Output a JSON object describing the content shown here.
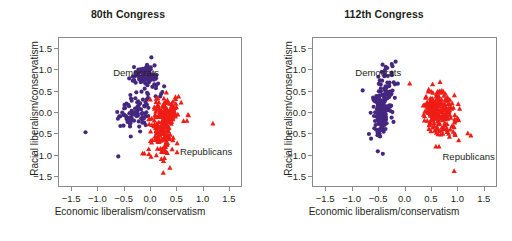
{
  "figure": {
    "background": "#ffffff",
    "axis_color": "#8a8a8a",
    "text_color": "#231f20"
  },
  "colors": {
    "democrat": "#45277f",
    "republican": "#ee1d16"
  },
  "chart_data": [
    {
      "type": "scatter",
      "title": "80th Congress",
      "xlabel": "Economic liberalism/conservatism",
      "ylabel": "Racial liberalism/conservatism",
      "xlim": [
        -1.75,
        1.75
      ],
      "ylim": [
        -1.75,
        1.75
      ],
      "xticks": [
        -1.5,
        -1.0,
        -0.5,
        0.0,
        0.5,
        1.0,
        1.5
      ],
      "xticklabels": [
        "−1.5",
        "−1.0",
        "−0.5",
        "0.0",
        "0.5",
        "1.0",
        "1.5"
      ],
      "yticks": [
        -1.5,
        -1.0,
        -0.5,
        0.0,
        0.5,
        1.0,
        1.5
      ],
      "yticklabels": [
        "−1.5",
        "−1.0",
        "−0.5",
        "0.0",
        "0.5",
        "1.0",
        "1.5"
      ],
      "grid": false,
      "legend_position": "inside-annotations",
      "annotations": [
        {
          "text": "Democrats",
          "x": -0.72,
          "y": 0.92
        },
        {
          "text": "Republicans",
          "x": 0.55,
          "y": -0.93
        }
      ],
      "series": [
        {
          "name": "Democrats",
          "marker": "circle",
          "color": "#45277f",
          "n": 188,
          "clusters": [
            {
              "cx": -0.07,
              "cy": 0.87,
              "sx": 0.115,
              "sy": 0.145,
              "n": 92,
              "seed": 11
            },
            {
              "cx": -0.3,
              "cy": -0.07,
              "sx": 0.135,
              "sy": 0.165,
              "n": 72,
              "seed": 23
            },
            {
              "cx": -0.1,
              "cy": 0.38,
              "sx": 0.12,
              "sy": 0.08,
              "n": 14,
              "seed": 37
            }
          ],
          "outliers": [
            {
              "x": -1.24,
              "y": -0.48
            },
            {
              "x": -0.61,
              "y": -1.05
            },
            {
              "x": -0.37,
              "y": -0.58
            },
            {
              "x": -0.19,
              "y": -0.46
            },
            {
              "x": 0.11,
              "y": 0.37
            },
            {
              "x": -0.63,
              "y": 0.0
            },
            {
              "x": -0.57,
              "y": -0.33
            }
          ]
        },
        {
          "name": "Republicans",
          "marker": "triangle",
          "color": "#ee1d16",
          "n": 246,
          "clusters": [
            {
              "cx": 0.24,
              "cy": -0.35,
              "sx": 0.135,
              "sy": 0.33,
              "n": 196,
              "seed": 41
            },
            {
              "cx": 0.42,
              "cy": -0.02,
              "sx": 0.125,
              "sy": 0.175,
              "n": 50,
              "seed": 53
            }
          ],
          "outliers": [
            {
              "x": 1.21,
              "y": -0.27
            },
            {
              "x": 0.74,
              "y": -0.07
            },
            {
              "x": 0.55,
              "y": 0.37
            },
            {
              "x": 0.49,
              "y": 0.36
            },
            {
              "x": -0.11,
              "y": -0.98
            },
            {
              "x": -0.02,
              "y": -0.99
            },
            {
              "x": 0.52,
              "y": -0.95
            }
          ]
        }
      ]
    },
    {
      "type": "scatter",
      "title": "112th Congress",
      "xlabel": "Economic liberalism/conservatism",
      "ylabel": "Racial liberalism/conservatism",
      "xlim": [
        -1.75,
        1.75
      ],
      "ylim": [
        -1.75,
        1.75
      ],
      "xticks": [
        -1.5,
        -1.0,
        -0.5,
        0.0,
        0.5,
        1.0,
        1.5
      ],
      "xticklabels": [
        "−1.5",
        "−1.0",
        "−0.5",
        "0.0",
        "0.5",
        "1.0",
        "1.5"
      ],
      "yticks": [
        -1.5,
        -1.0,
        -0.5,
        0.0,
        0.5,
        1.0,
        1.5
      ],
      "yticklabels": [
        "−1.5",
        "−1.0",
        "−0.5",
        "0.0",
        "0.5",
        "1.0",
        "1.5"
      ],
      "grid": false,
      "legend_position": "inside-annotations",
      "annotations": [
        {
          "text": "Democrats",
          "x": -0.95,
          "y": 0.92
        },
        {
          "text": "Republicans",
          "x": 0.7,
          "y": -1.05
        }
      ],
      "series": [
        {
          "name": "Democrats",
          "marker": "circle",
          "color": "#45277f",
          "n": 196,
          "clusters": [
            {
              "cx": -0.44,
              "cy": -0.07,
              "sx": 0.095,
              "sy": 0.275,
              "n": 150,
              "seed": 67
            },
            {
              "cx": -0.34,
              "cy": 0.58,
              "sx": 0.105,
              "sy": 0.21,
              "n": 46,
              "seed": 79
            }
          ],
          "outliers": [
            {
              "x": -0.8,
              "y": 0.51
            },
            {
              "x": -0.51,
              "y": -0.93
            },
            {
              "x": -0.17,
              "y": 1.19
            },
            {
              "x": -0.33,
              "y": 1.04
            },
            {
              "x": -0.42,
              "y": 1.12
            },
            {
              "x": -0.64,
              "y": -0.63
            },
            {
              "x": -0.68,
              "y": -0.52
            }
          ]
        },
        {
          "name": "Republicans",
          "marker": "triangle",
          "color": "#ee1d16",
          "n": 242,
          "clusters": [
            {
              "cx": 0.66,
              "cy": 0.13,
              "sx": 0.145,
              "sy": 0.215,
              "n": 195,
              "seed": 83
            },
            {
              "cx": 0.72,
              "cy": -0.32,
              "sx": 0.175,
              "sy": 0.145,
              "n": 47,
              "seed": 97
            }
          ],
          "outliers": [
            {
              "x": 0.1,
              "y": 0.68
            },
            {
              "x": 1.21,
              "y": -0.5
            },
            {
              "x": 1.27,
              "y": -0.55
            },
            {
              "x": 0.97,
              "y": -0.54
            },
            {
              "x": 0.86,
              "y": -0.58
            },
            {
              "x": 0.6,
              "y": -0.81
            },
            {
              "x": 0.66,
              "y": -0.81
            },
            {
              "x": 0.95,
              "y": -1.39
            }
          ]
        }
      ]
    }
  ]
}
